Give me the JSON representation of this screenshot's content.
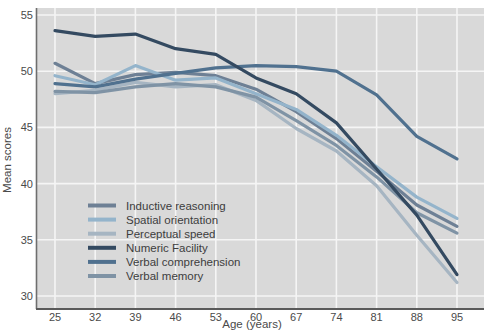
{
  "chart_data": {
    "type": "line",
    "title": "",
    "xlabel": "Age (years)",
    "ylabel": "Mean scores",
    "x": [
      25,
      32,
      39,
      46,
      53,
      60,
      67,
      74,
      81,
      88,
      95
    ],
    "xlim": [
      25,
      95
    ],
    "ylim": [
      30,
      55
    ],
    "yticks": [
      55,
      50,
      45,
      40,
      35,
      30
    ],
    "grid": true,
    "plot_background": "#d9d9d9",
    "gridline_color": "#f5f5f5",
    "axis_spine_color": "#5a5a5a",
    "tick_label_color": "#4a4a4a",
    "legend_position": "lower-left-inside",
    "legend_text_color": "#3d3d3d",
    "series": [
      {
        "name": "Inductive reasoning",
        "slug": "inductive-reasoning",
        "color": "#6e8095",
        "values": [
          50.7,
          48.9,
          49.7,
          49.9,
          49.6,
          48.4,
          46.4,
          44.0,
          41.1,
          38.1,
          36.2
        ]
      },
      {
        "name": "Spatial orientation",
        "slug": "spatial-orientation",
        "color": "#94b4cb",
        "values": [
          49.6,
          48.8,
          50.5,
          49.2,
          49.4,
          48.0,
          46.6,
          44.3,
          41.5,
          38.8,
          36.9
        ]
      },
      {
        "name": "Perceptual speed",
        "slug": "perceptual-speed",
        "color": "#a6b5c2",
        "values": [
          48.0,
          48.3,
          49.0,
          48.6,
          48.8,
          47.4,
          44.9,
          42.9,
          39.8,
          35.4,
          31.2
        ]
      },
      {
        "name": "Numeric Facility",
        "slug": "numeric-facility",
        "color": "#344a61",
        "values": [
          53.6,
          53.1,
          53.3,
          52.0,
          51.5,
          49.4,
          48.0,
          45.4,
          41.3,
          37.2,
          31.9
        ]
      },
      {
        "name": "Verbal comprehension",
        "slug": "verbal-comprehension",
        "color": "#50718f",
        "values": [
          48.9,
          48.6,
          49.3,
          49.8,
          50.3,
          50.5,
          50.4,
          50.0,
          47.9,
          44.2,
          42.2
        ]
      },
      {
        "name": "Verbal memory",
        "slug": "verbal-memory",
        "color": "#7f93a5",
        "values": [
          48.2,
          48.1,
          48.6,
          48.9,
          48.6,
          47.7,
          45.6,
          43.4,
          40.6,
          37.4,
          35.6
        ]
      }
    ]
  }
}
